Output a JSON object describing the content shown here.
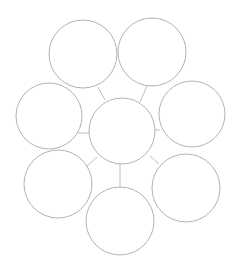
{
  "diagram": {
    "type": "hub-and-spoke circle map",
    "background": "#ffffff",
    "stroke_color": "#a9a9a9",
    "connector_color": "#b4b4b4",
    "center": {
      "id": "center",
      "label": "",
      "cx": 122,
      "cy": 131,
      "r": 33
    },
    "nodes": [
      {
        "id": "top-left",
        "label": "",
        "cx": 83,
        "cy": 54,
        "r": 34
      },
      {
        "id": "top-right",
        "label": "",
        "cx": 152,
        "cy": 52,
        "r": 34
      },
      {
        "id": "left",
        "label": "",
        "cx": 49,
        "cy": 116,
        "r": 33
      },
      {
        "id": "right",
        "label": "",
        "cx": 192,
        "cy": 114,
        "r": 33
      },
      {
        "id": "bottom-left",
        "label": "",
        "cx": 58,
        "cy": 184,
        "r": 34
      },
      {
        "id": "bottom-right",
        "label": "",
        "cx": 186,
        "cy": 188,
        "r": 34
      },
      {
        "id": "bottom",
        "label": "",
        "cx": 120,
        "cy": 221,
        "r": 34
      }
    ],
    "edges": [
      {
        "from": "top-left",
        "to": "center",
        "x1": 98,
        "y1": 87,
        "x2": 105,
        "y2": 100
      },
      {
        "from": "top-right",
        "to": "center",
        "x1": 147,
        "y1": 86,
        "x2": 140,
        "y2": 102
      },
      {
        "from": "left",
        "to": "center",
        "x1": 78,
        "y1": 133,
        "x2": 89,
        "y2": 133
      },
      {
        "from": "right",
        "to": "center",
        "x1": 154,
        "y1": 130,
        "x2": 160,
        "y2": 130
      },
      {
        "from": "bottom-left",
        "to": "center",
        "x1": 87,
        "y1": 166,
        "x2": 97,
        "y2": 157
      },
      {
        "from": "bottom-right",
        "to": "center",
        "x1": 150,
        "y1": 156,
        "x2": 159,
        "y2": 164
      },
      {
        "from": "bottom",
        "to": "center",
        "x1": 120,
        "y1": 164,
        "x2": 120,
        "y2": 187
      }
    ]
  }
}
